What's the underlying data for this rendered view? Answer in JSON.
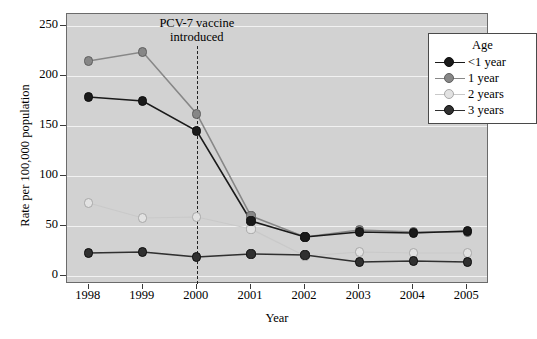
{
  "chart_data": {
    "type": "line",
    "title": "",
    "xlabel": "Year",
    "ylabel": "Rate per 100,000 population",
    "categories": [
      "1998",
      "1999",
      "2000",
      "2001",
      "2002",
      "2003",
      "2004",
      "2005"
    ],
    "x": [
      1998,
      1999,
      2000,
      2001,
      2002,
      2003,
      2004,
      2005
    ],
    "xlim": [
      1997.6,
      2005.4
    ],
    "ylim": [
      -8,
      262
    ],
    "yticks": [
      0,
      50,
      100,
      150,
      200,
      250
    ],
    "xticks": [
      "1998",
      "1999",
      "2000",
      "2001",
      "2002",
      "2003",
      "2004",
      "2005"
    ],
    "grid": "horizontal",
    "legend_position": "top-right",
    "legend_title": "Age",
    "series": [
      {
        "name": "<1 year",
        "color": "#1a1a1a",
        "marker": "filled-circle",
        "values": [
          179,
          175,
          145,
          55,
          39,
          44,
          43,
          45
        ]
      },
      {
        "name": "1 year",
        "color": "#878787",
        "marker": "filled-circle-gray",
        "values": [
          215,
          224,
          162,
          60,
          39,
          46,
          44,
          44
        ]
      },
      {
        "name": "2 years",
        "color": "#c9c9c9",
        "marker": "open-circle",
        "values": [
          73,
          58,
          59,
          47,
          20,
          24,
          23,
          23
        ]
      },
      {
        "name": "3 years",
        "color": "#303030",
        "marker": "filled-circle",
        "values": [
          23,
          24,
          19,
          22,
          21,
          14,
          15,
          14
        ]
      }
    ],
    "annotations": [
      {
        "text_line1": "PCV-7 vaccine",
        "text_line2": "introduced",
        "x": 2000,
        "type": "vertical-dashed-line-with-label"
      }
    ]
  },
  "legend": {
    "title": "Age",
    "items": [
      {
        "label": "<1 year"
      },
      {
        "label": "1 year"
      },
      {
        "label": "2 years"
      },
      {
        "label": "3 years"
      }
    ]
  },
  "axes": {
    "x_title": "Year",
    "y_title": "Rate per 100,000 population",
    "y_tick_labels": [
      "250",
      "200",
      "150",
      "100",
      "50",
      "0"
    ],
    "x_tick_labels": [
      "1998",
      "1999",
      "2000",
      "2001",
      "2002",
      "2003",
      "2004",
      "2005"
    ]
  },
  "annotation": {
    "line1": "PCV-7 vaccine",
    "line2": "introduced"
  },
  "colors": {
    "panel_background": "#d2d2d2",
    "gridline": "#f2f2f2",
    "series_under_1": "#1a1a1a",
    "series_1_year": "#878787",
    "series_2_years": "#c9c9c9",
    "series_3_years": "#303030",
    "axis": "#6b6b6b",
    "page_background": "#ffffff"
  }
}
